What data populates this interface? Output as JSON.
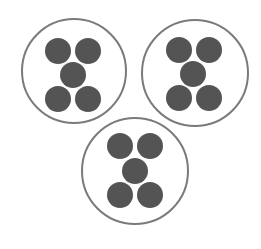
{
  "diagram": {
    "background": "#ffffff",
    "ring_color": "#7a7a7a",
    "dot_color": "#545454",
    "groups": [
      {
        "label": "group-top-left",
        "cx": 74,
        "cy": 71,
        "r": 52,
        "dots": [
          {
            "cx": 58,
            "cy": 51,
            "r": 13
          },
          {
            "cx": 88,
            "cy": 51,
            "r": 13
          },
          {
            "cx": 73,
            "cy": 75,
            "r": 13
          },
          {
            "cx": 58,
            "cy": 99,
            "r": 13
          },
          {
            "cx": 88,
            "cy": 99,
            "r": 13
          }
        ]
      },
      {
        "label": "group-top-right",
        "cx": 195,
        "cy": 73,
        "r": 53,
        "dots": [
          {
            "cx": 179,
            "cy": 50,
            "r": 13
          },
          {
            "cx": 209,
            "cy": 50,
            "r": 13
          },
          {
            "cx": 193,
            "cy": 74,
            "r": 13
          },
          {
            "cx": 179,
            "cy": 98,
            "r": 13
          },
          {
            "cx": 209,
            "cy": 98,
            "r": 13
          }
        ]
      },
      {
        "label": "group-bottom",
        "cx": 135,
        "cy": 171,
        "r": 53,
        "dots": [
          {
            "cx": 120,
            "cy": 146,
            "r": 13
          },
          {
            "cx": 150,
            "cy": 146,
            "r": 13
          },
          {
            "cx": 135,
            "cy": 171,
            "r": 13
          },
          {
            "cx": 120,
            "cy": 195,
            "r": 13
          },
          {
            "cx": 150,
            "cy": 195,
            "r": 13
          }
        ]
      }
    ]
  }
}
